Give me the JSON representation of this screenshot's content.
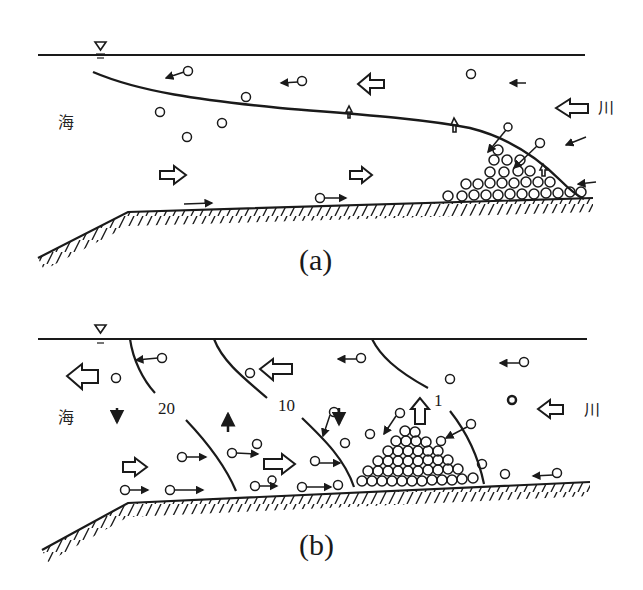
{
  "figure": {
    "panels": [
      {
        "id": "a",
        "caption": "(a)",
        "left_label": "海",
        "right_label": "川",
        "description": "Salt-wedge estuary: interface between river water and sea water with sediment deposit at the wedge tip"
      },
      {
        "id": "b",
        "caption": "(b)",
        "left_label": "海",
        "right_label": "川",
        "description": "Partially mixed estuary with salinity isolines and turbidity-maximum sediment deposit",
        "isoline_labels": [
          "20",
          "10",
          "1"
        ]
      }
    ],
    "symbols": {
      "water_surface": "water-level-triangle",
      "flow_arrow": "hollow-block-arrow",
      "particle": "small-circle",
      "bed": "hatched-seabed"
    },
    "colors": {
      "ink": "#1a1a1a",
      "background": "#ffffff"
    }
  }
}
